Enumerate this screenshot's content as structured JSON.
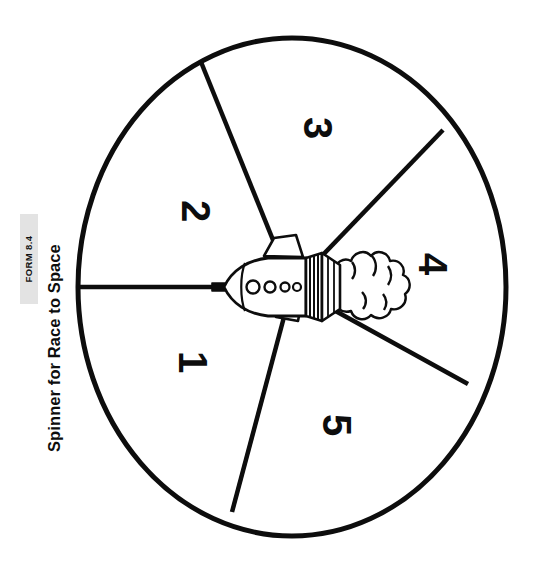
{
  "document": {
    "form_badge": "FORM 8.4",
    "title": "Spinner for Race to Space",
    "background_color": "#ffffff",
    "ink_color": "#0d0d0d",
    "badge_background_color": "#e3e3e3"
  },
  "spinner": {
    "name": "race-to-space-spinner",
    "sector_count": 5,
    "center_graphic": "space-shuttle-rocket",
    "orientation_note": "numbers rotated 90 degrees clockwise",
    "sectors": [
      {
        "label": "1",
        "x": 193,
        "y": 362
      },
      {
        "label": "2",
        "x": 196,
        "y": 211
      },
      {
        "label": "3",
        "x": 318,
        "y": 128
      },
      {
        "label": "4",
        "x": 433,
        "y": 264
      },
      {
        "label": "5",
        "x": 337,
        "y": 425
      }
    ],
    "geometry": {
      "center_x": 292,
      "center_y": 287,
      "radius_x": 214,
      "radius_y": 249,
      "stroke_width": 5,
      "divider_endpoints": [
        {
          "name": "divider-west",
          "x": 78,
          "y": 287
        },
        {
          "name": "divider-northwest",
          "x": 201,
          "y": 62
        },
        {
          "name": "divider-northeast",
          "x": 443,
          "y": 130
        },
        {
          "name": "divider-southeast",
          "x": 468,
          "y": 384
        },
        {
          "name": "divider-southwest",
          "x": 232,
          "y": 512
        }
      ]
    }
  }
}
